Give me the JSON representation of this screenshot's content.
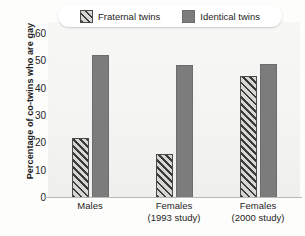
{
  "chart_data": {
    "type": "bar",
    "title": "",
    "xlabel": "",
    "ylabel": "Percentage of co-twins who are gay",
    "ylim": [
      0,
      60
    ],
    "yticks": [
      0,
      10,
      20,
      30,
      40,
      50,
      60
    ],
    "grid": false,
    "legend_position": "top",
    "categories": [
      "Males",
      "Females (1993 study)",
      "Females (2000 study)"
    ],
    "category_lines": [
      {
        "line1": "Males",
        "line2": ""
      },
      {
        "line1": "Females",
        "line2": "(1993 study)"
      },
      {
        "line1": "Females",
        "line2": "(2000 study)"
      }
    ],
    "series": [
      {
        "name": "Fraternal twins",
        "values": [
          22,
          16,
          44.5
        ],
        "pattern": "diagonal-hatch",
        "color": "#cfcfcb"
      },
      {
        "name": "Identical twins",
        "values": [
          52.5,
          48.5,
          49
        ],
        "pattern": "solid",
        "color": "#7c7c7c"
      }
    ]
  },
  "legend": {
    "items": [
      {
        "label": "Fraternal twins",
        "swatch": "hatch-swatch-icon"
      },
      {
        "label": "Identical twins",
        "swatch": "solid-swatch-icon"
      }
    ]
  }
}
